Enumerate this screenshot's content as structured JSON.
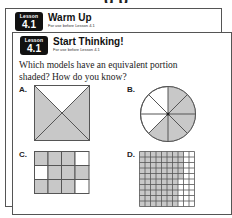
{
  "back_card": {
    "badge": {
      "label": "Lesson",
      "number": "4.1"
    },
    "title": "Warm Up",
    "subtitle": "For use before Lesson 4.1"
  },
  "front_card": {
    "badge": {
      "label": "Lesson",
      "number": "4.1"
    },
    "title": "Start Thinking!",
    "subtitle": "For use before Lesson 4.1",
    "question": "Which models have an equivalent portion shaded? How do you know?",
    "models": [
      {
        "label": "A.",
        "type": "square-diagonals",
        "parts": 4,
        "shaded": 3,
        "description": "square split by diagonals, top triangle unshaded"
      },
      {
        "label": "B.",
        "type": "circle",
        "parts": 8,
        "shaded": 5,
        "description": "circle with 8 sectors, 5 shaded"
      },
      {
        "label": "C.",
        "type": "grid",
        "rows": 3,
        "cols": 4,
        "shaded": 9,
        "pattern": [
          [
            1,
            1,
            1,
            0
          ],
          [
            0,
            1,
            1,
            1
          ],
          [
            1,
            1,
            1,
            0
          ]
        ]
      },
      {
        "label": "D.",
        "type": "grid",
        "rows": 10,
        "cols": 10,
        "shaded": 75,
        "description": "10x10 grid, top 5 rows 8 shaded, bottom 5 rows 7 shaded"
      }
    ]
  },
  "colors": {
    "shade": "#c8c8c8",
    "line": "#555555",
    "badge": "#111111"
  }
}
